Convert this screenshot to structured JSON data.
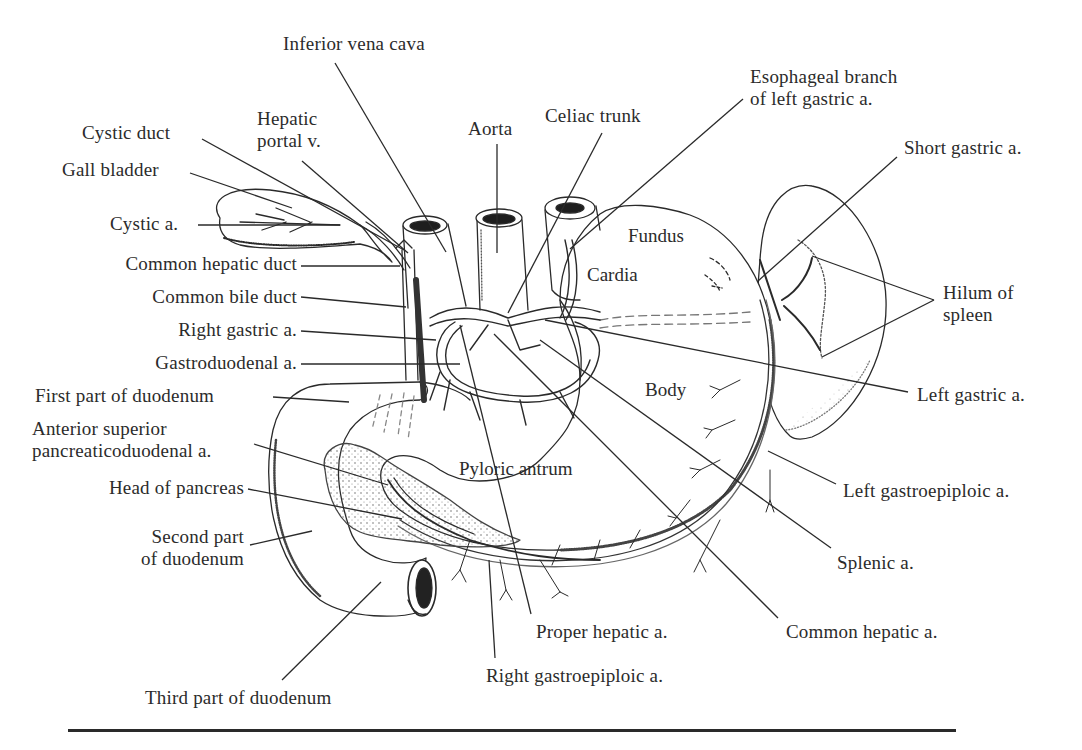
{
  "figure": {
    "type": "anatomical-line-drawing",
    "ink_color": "#2a2a2a",
    "background": "#ffffff"
  },
  "labels": [
    {
      "id": "inferior-vena-cava",
      "lines": [
        "Inferior vena cava"
      ],
      "x": 283,
      "y": 33,
      "align": "l",
      "leader": [
        [
          335,
          63
        ],
        [
          446,
          252
        ]
      ]
    },
    {
      "id": "hepatic-portal-v",
      "lines": [
        "Hepatic",
        "portal v."
      ],
      "x": 257,
      "y": 108,
      "align": "l",
      "leader": [
        [
          302,
          161
        ],
        [
          408,
          253
        ]
      ]
    },
    {
      "id": "aorta",
      "lines": [
        "Aorta"
      ],
      "x": 468,
      "y": 118,
      "align": "l",
      "leader": [
        [
          497,
          144
        ],
        [
          497,
          253
        ]
      ]
    },
    {
      "id": "celiac-trunk",
      "lines": [
        "Celiac trunk"
      ],
      "x": 545,
      "y": 105,
      "align": "l",
      "leader": [
        [
          602,
          133
        ],
        [
          508,
          313
        ]
      ]
    },
    {
      "id": "esophageal-branch",
      "lines": [
        "Esophageal branch",
        "of left gastric a."
      ],
      "x": 750,
      "y": 66,
      "align": "l",
      "leader": [
        [
          743,
          99
        ],
        [
          570,
          249
        ]
      ]
    },
    {
      "id": "short-gastric-a",
      "lines": [
        "Short gastric a."
      ],
      "x": 904,
      "y": 137,
      "align": "l",
      "leader": [
        [
          897,
          157
        ],
        [
          758,
          281
        ]
      ]
    },
    {
      "id": "hilum-of-spleen",
      "lines": [
        "Hilum of",
        "spleen"
      ],
      "x": 943,
      "y": 282,
      "align": "l",
      "leader": [
        [
          934,
          300
        ],
        [
          812,
          256
        ]
      ],
      "leader2": [
        [
          934,
          300
        ],
        [
          822,
          357
        ]
      ]
    },
    {
      "id": "left-gastric-a",
      "lines": [
        "Left gastric a."
      ],
      "x": 917,
      "y": 384,
      "align": "l",
      "leader": [
        [
          908,
          392
        ],
        [
          545,
          320
        ]
      ]
    },
    {
      "id": "left-gastroepiploic-a",
      "lines": [
        "Left gastroepiploic a."
      ],
      "x": 843,
      "y": 480,
      "align": "l",
      "leader": [
        [
          836,
          484
        ],
        [
          768,
          451
        ]
      ]
    },
    {
      "id": "splenic-a",
      "lines": [
        "Splenic a."
      ],
      "x": 837,
      "y": 552,
      "align": "l",
      "leader": [
        [
          831,
          548
        ],
        [
          540,
          340
        ]
      ]
    },
    {
      "id": "common-hepatic-a",
      "lines": [
        "Common hepatic a."
      ],
      "x": 786,
      "y": 621,
      "align": "l",
      "leader": [
        [
          778,
          618
        ],
        [
          494,
          334
        ]
      ]
    },
    {
      "id": "proper-hepatic-a",
      "lines": [
        "Proper hepatic a."
      ],
      "x": 536,
      "y": 621,
      "align": "l",
      "leader": [
        [
          531,
          614
        ],
        [
          460,
          325
        ]
      ]
    },
    {
      "id": "right-gastroepiploic-a",
      "lines": [
        "Right gastroepiploic a."
      ],
      "x": 486,
      "y": 665,
      "align": "l",
      "leader": [
        [
          495,
          658
        ],
        [
          489,
          560
        ]
      ]
    },
    {
      "id": "third-part-of-duodenum",
      "lines": [
        "Third part of duodenum"
      ],
      "x": 145,
      "y": 687,
      "align": "l",
      "leader": [
        [
          282,
          680
        ],
        [
          381,
          582
        ]
      ]
    },
    {
      "id": "second-part-of-duodenum",
      "lines": [
        "Second part",
        "of duodenum"
      ],
      "x": 110,
      "y": 526,
      "align": "r",
      "w": 134,
      "leader": [
        [
          250,
          545
        ],
        [
          312,
          531
        ]
      ]
    },
    {
      "id": "head-of-pancreas",
      "lines": [
        "Head of pancreas"
      ],
      "x": 66,
      "y": 477,
      "align": "r",
      "w": 178,
      "leader": [
        [
          248,
          489
        ],
        [
          402,
          519
        ]
      ]
    },
    {
      "id": "anterior-superior-pancreaticoduodenal-a",
      "lines": [
        "Anterior superior",
        "pancreaticoduodenal a."
      ],
      "x": 32,
      "y": 418,
      "align": "l",
      "leader": [
        [
          254,
          444
        ],
        [
          388,
          485
        ]
      ]
    },
    {
      "id": "first-part-of-duodenum",
      "lines": [
        "First part of duodenum"
      ],
      "x": 35,
      "y": 385,
      "align": "l",
      "leader": [
        [
          273,
          397
        ],
        [
          349,
          402
        ]
      ]
    },
    {
      "id": "gastroduodenal-a",
      "lines": [
        "Gastroduodenal a."
      ],
      "x": 111,
      "y": 352,
      "align": "r",
      "w": 186,
      "leader": [
        [
          301,
          364
        ],
        [
          460,
          364
        ]
      ]
    },
    {
      "id": "right-gastric-a",
      "lines": [
        "Right gastric a."
      ],
      "x": 147,
      "y": 319,
      "align": "r",
      "w": 150,
      "leader": [
        [
          301,
          331
        ],
        [
          436,
          340
        ]
      ]
    },
    {
      "id": "common-bile-duct",
      "lines": [
        "Common bile duct"
      ],
      "x": 108,
      "y": 286,
      "align": "r",
      "w": 189,
      "leader": [
        [
          301,
          297
        ],
        [
          406,
          307
        ]
      ]
    },
    {
      "id": "common-hepatic-duct",
      "lines": [
        "Common hepatic duct"
      ],
      "x": 73,
      "y": 253,
      "align": "r",
      "w": 224,
      "leader": [
        [
          301,
          266
        ],
        [
          400,
          266
        ]
      ]
    },
    {
      "id": "cystic-a",
      "lines": [
        "Cystic a."
      ],
      "x": 110,
      "y": 213,
      "align": "l",
      "leader": [
        [
          198,
          225
        ],
        [
          340,
          225
        ]
      ]
    },
    {
      "id": "gall-bladder",
      "lines": [
        "Gall bladder"
      ],
      "x": 62,
      "y": 159,
      "align": "l",
      "leader": [
        [
          190,
          173
        ],
        [
          292,
          208
        ]
      ]
    },
    {
      "id": "cystic-duct",
      "lines": [
        "Cystic duct"
      ],
      "x": 82,
      "y": 122,
      "align": "l",
      "leader": [
        [
          202,
          139
        ],
        [
          404,
          250
        ]
      ]
    }
  ],
  "inner_labels": [
    {
      "id": "fundus",
      "text": "Fundus",
      "x": 628,
      "y": 225
    },
    {
      "id": "cardia",
      "text": "Cardia",
      "x": 587,
      "y": 264
    },
    {
      "id": "body",
      "text": "Body",
      "x": 645,
      "y": 379
    },
    {
      "id": "pyloric-antrum",
      "text": "Pyloric antrum",
      "x": 459,
      "y": 458
    }
  ],
  "rule": {
    "x1": 68,
    "x2": 956,
    "y": 730
  }
}
